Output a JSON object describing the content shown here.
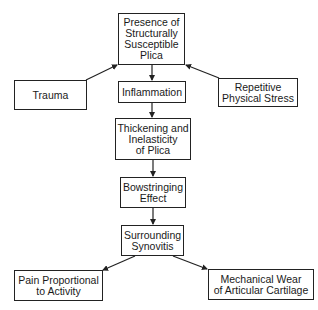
{
  "diagram": {
    "type": "flowchart",
    "nodes": [
      {
        "id": "presence",
        "label": "Presence of\nStructurally\nSusceptible\nPlica"
      },
      {
        "id": "trauma",
        "label": "Trauma"
      },
      {
        "id": "inflammation",
        "label": "Inflammation"
      },
      {
        "id": "repetitive",
        "label": "Repetitive\nPhysical Stress"
      },
      {
        "id": "thickening",
        "label": "Thickening and\nInelasticity\nof Plica"
      },
      {
        "id": "bowstringing",
        "label": "Bowstringing\nEffect"
      },
      {
        "id": "synovitis",
        "label": "Surrounding\nSynovitis"
      },
      {
        "id": "pain",
        "label": "Pain Proportional\nto Activity"
      },
      {
        "id": "wear",
        "label": "Mechanical Wear\nof Articular Cartilage"
      }
    ],
    "edges": [
      {
        "from": "trauma",
        "to": "presence"
      },
      {
        "from": "repetitive",
        "to": "presence"
      },
      {
        "from": "presence",
        "to": "inflammation"
      },
      {
        "from": "inflammation",
        "to": "thickening"
      },
      {
        "from": "thickening",
        "to": "bowstringing"
      },
      {
        "from": "bowstringing",
        "to": "synovitis"
      },
      {
        "from": "synovitis",
        "to": "pain"
      },
      {
        "from": "synovitis",
        "to": "wear"
      }
    ],
    "colors": {
      "stroke": "#222222",
      "background": "#ffffff",
      "text": "#1a1a1a"
    }
  }
}
